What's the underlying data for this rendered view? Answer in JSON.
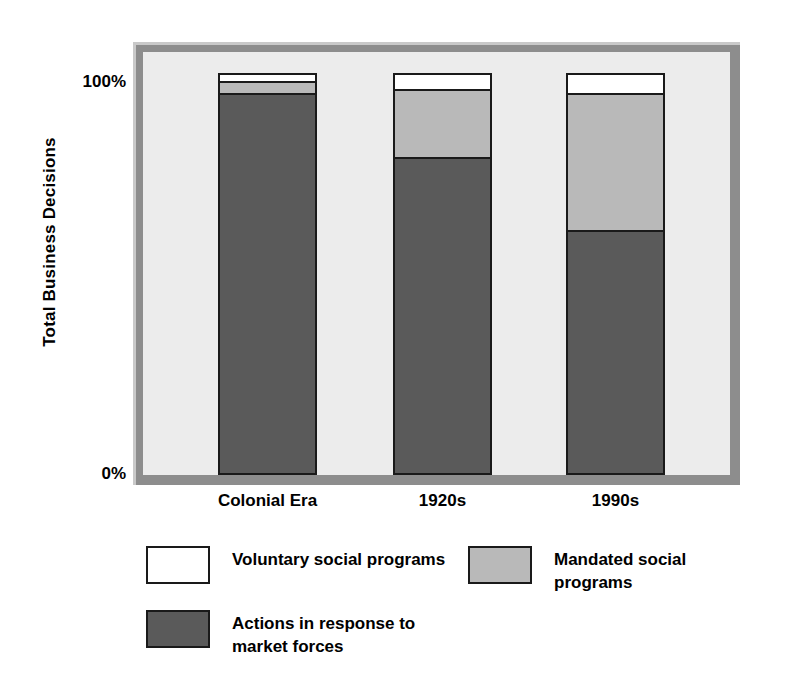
{
  "chart_data": {
    "type": "bar",
    "subtype": "stacked-percentage",
    "title": "",
    "xlabel": "",
    "ylabel": "Total Business Decisions",
    "ylim": [
      0,
      100
    ],
    "yticks": [
      "0%",
      "100%"
    ],
    "ytick_values": [
      0,
      100
    ],
    "grid": false,
    "legend_position": "bottom",
    "categories": [
      "Colonial\nEra",
      "1920s",
      "1990s"
    ],
    "series": [
      {
        "name": "Voluntary social programs",
        "color": "#ffffff",
        "values": [
          2,
          4,
          5
        ]
      },
      {
        "name": "Mandated social programs",
        "color": "#b9b9b9",
        "values": [
          3,
          17,
          34
        ]
      },
      {
        "name": "Actions in response to\nmarket forces",
        "color": "#5a5a5a",
        "values": [
          95,
          79,
          61
        ]
      }
    ]
  },
  "axis": {
    "y_title": "Total Business Decisions",
    "tick_top": "100%",
    "tick_bottom": "0%"
  },
  "categories": [
    {
      "label": "Colonial\nEra"
    },
    {
      "label": "1920s"
    },
    {
      "label": "1990s"
    }
  ],
  "legend": {
    "items": [
      {
        "label": "Voluntary social programs",
        "color": "#ffffff"
      },
      {
        "label": "Mandated social\nprograms",
        "color": "#b9b9b9"
      },
      {
        "label": "Actions in response to\nmarket forces",
        "color": "#5a5a5a"
      }
    ]
  },
  "colors": {
    "voluntary": "#ffffff",
    "mandated": "#b9b9b9",
    "market": "#5a5a5a",
    "plot_background": "#ececec",
    "frame": "#8d8d8d",
    "outline": "#1a1a1a"
  }
}
